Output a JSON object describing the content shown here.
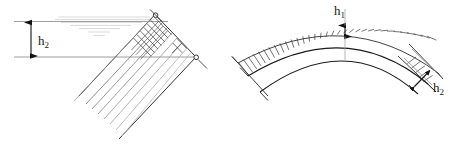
{
  "figure": {
    "background_color": "#ffffff",
    "line_color": "#1a1a1a",
    "faint_line_color": "#b8b8b8",
    "mid_line_color": "#6e6e6e",
    "width": 462,
    "height": 146
  },
  "left_view": {
    "name": "inclined-arch-segment-view",
    "description": "Rotated rectangular arch strip with radial hatching and horizontal extension lines",
    "dimension": {
      "label_base": "h",
      "label_sub": "2",
      "label_full": "h2",
      "orientation": "vertical",
      "arrow_style": "double-headed"
    },
    "extension_lines": {
      "top_y": 22,
      "bottom_y": 57,
      "x_start": 14,
      "x_end": 170
    },
    "arrow_x": 31,
    "faint_artifact_lines": [
      {
        "x1": 58,
        "y1": 17,
        "x2": 148,
        "y2": 17
      },
      {
        "x1": 56,
        "y1": 20,
        "x2": 152,
        "y2": 20
      },
      {
        "x1": 62,
        "y1": 23,
        "x2": 140,
        "y2": 23
      },
      {
        "x1": 70,
        "y1": 26,
        "x2": 130,
        "y2": 26
      },
      {
        "x1": 78,
        "y1": 30,
        "x2": 118,
        "y2": 30
      },
      {
        "x1": 86,
        "y1": 34,
        "x2": 108,
        "y2": 34
      }
    ]
  },
  "right_view": {
    "name": "arch-elevation-view",
    "description": "Semi-elliptical arch with concentric extrados and intrados curves and radial load hatching",
    "crown_dimension": {
      "label_base": "h",
      "label_sub": "1",
      "label_full": "h1",
      "orientation": "vertical",
      "arrow_style": "double-headed",
      "location": "crown"
    },
    "haunch_dimension": {
      "label_base": "h",
      "label_sub": "2",
      "label_full": "h2",
      "orientation": "inclined",
      "arrow_style": "double-headed",
      "location": "right-haunch"
    },
    "hatch_count": 34
  }
}
